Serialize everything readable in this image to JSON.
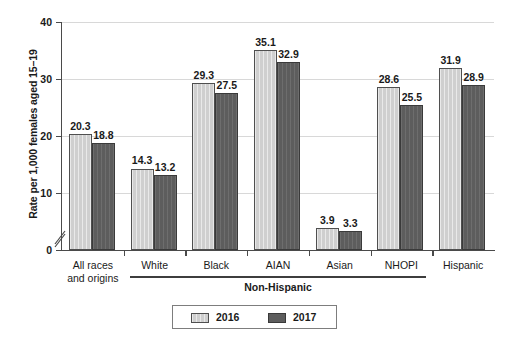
{
  "chart_data": {
    "type": "bar",
    "title": "",
    "xlabel": "",
    "ylabel": "Rate per 1,000 females aged 15–19",
    "ylim": [
      0,
      40
    ],
    "yticks": [
      0,
      10,
      20,
      30,
      40
    ],
    "ytick_labels": [
      "0",
      "10",
      "20",
      "30",
      "40"
    ],
    "grid": true,
    "axis_break": true,
    "legend_position": "bottom-center",
    "categories": [
      "All races and origins",
      "White",
      "Black",
      "AIAN",
      "Asian",
      "NHOPI",
      "Hispanic"
    ],
    "category_lines": [
      [
        "All races",
        "and origins"
      ],
      [
        "White"
      ],
      [
        "Black"
      ],
      [
        "AIAN"
      ],
      [
        "Asian"
      ],
      [
        "NHOPI"
      ],
      [
        "Hispanic"
      ]
    ],
    "group_brackets": [
      {
        "label": "Non-Hispanic",
        "from": 1,
        "to": 5
      }
    ],
    "series": [
      {
        "name": "2016",
        "color": "#cfcfcf",
        "values": [
          20.3,
          14.3,
          29.3,
          35.1,
          3.9,
          28.6,
          31.9
        ],
        "labels": [
          "20.3",
          "14.3",
          "29.3",
          "35.1",
          "3.9",
          "28.6",
          "31.9"
        ]
      },
      {
        "name": "2017",
        "color": "#5d5d5d",
        "values": [
          18.8,
          13.2,
          27.5,
          32.9,
          3.3,
          25.5,
          28.9
        ],
        "labels": [
          "18.8",
          "13.2",
          "27.5",
          "32.9",
          "3.3",
          "25.5",
          "28.9"
        ]
      }
    ]
  },
  "legend": {
    "items": [
      {
        "label": "2016",
        "color": "#cfcfcf"
      },
      {
        "label": "2017",
        "color": "#5d5d5d"
      }
    ]
  }
}
